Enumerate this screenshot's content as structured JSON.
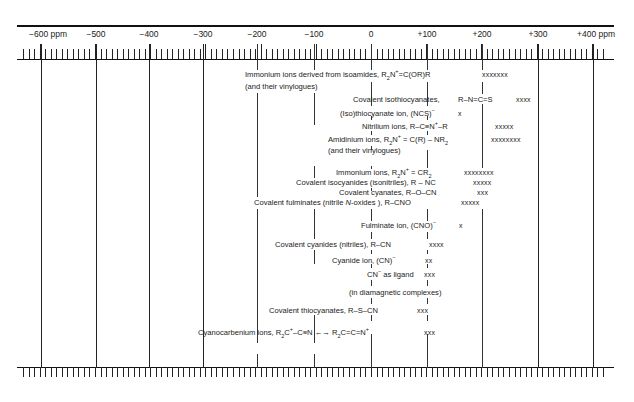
{
  "chart_data": {
    "type": "range-chart",
    "title": "",
    "xlabel": "ppm",
    "axis": {
      "min": -650,
      "max": 420,
      "major_ticks": [
        -600,
        -500,
        -400,
        -300,
        -200,
        -100,
        0,
        100,
        200,
        300,
        400
      ],
      "tick_labels": [
        "−600 ppm",
        "−500",
        "−400",
        "−300",
        "−200",
        "−100",
        "0",
        "+100",
        "+200",
        "+300",
        "+400 ppm"
      ],
      "minor_tick_step": 10,
      "grid": true
    },
    "entries": [
      {
        "label": "Immonium ions derived from isoamides, R₂N⁺=C(OR)R (and their vinylogues)",
        "range_ppm": [
          -200,
          0
        ],
        "marker": "xxxxxxx",
        "marker_ppm": 200
      },
      {
        "label": "Covalent isothiocyanates, R–N=C=S",
        "range_ppm": [
          -100,
          100
        ],
        "marker": "xxxx",
        "marker_ppm": 270
      },
      {
        "label": "(Iso)thiocyanate ion, (NCS)⁻",
        "range_ppm": [
          0,
          100
        ],
        "marker": "x",
        "marker_ppm": 165
      },
      {
        "label": "Nitrilium ions, R–C≡N⁺–R",
        "range_ppm": [
          0,
          100
        ],
        "marker": "xxxxx",
        "marker_ppm": 215
      },
      {
        "label": "Amidinium ions, R₂N⁺ = C(R) – NR₂ (and their vinylogues)",
        "range_ppm": [
          0,
          100
        ],
        "marker": "xxxxxxxx",
        "marker_ppm": 215
      },
      {
        "label": "Immonium ions, R₂N⁺ = CR₂",
        "range_ppm": [
          0,
          100
        ],
        "marker": "xxxxxxxx",
        "marker_ppm": 195
      },
      {
        "label": "Covalent isocyanides (isonitriles), R – NC",
        "range_ppm": [
          -100,
          100
        ],
        "marker": "xxxxx",
        "marker_ppm": 200
      },
      {
        "label": "Covalent cyanates, R–O–CN",
        "range_ppm": [
          0,
          100
        ],
        "marker": "xxx",
        "marker_ppm": 200
      },
      {
        "label": "Covalent fulminates (nitrile N-oxides), R–CNO",
        "range_ppm": [
          -200,
          100
        ],
        "marker": "xxxxx",
        "marker_ppm": 180
      },
      {
        "label": "Fulminate ion, (CNO)⁻",
        "range_ppm": [
          0,
          100
        ],
        "marker": "x",
        "marker_ppm": 165
      },
      {
        "label": "Covalent cyanides (nitriles), R–CN",
        "range_ppm": [
          -100,
          100
        ],
        "marker": "xxxx",
        "marker_ppm": 130
      },
      {
        "label": "Cyanide ion, (CN)⁻",
        "range_ppm": [
          -100,
          100
        ],
        "marker": "xx",
        "marker_ppm": 100
      },
      {
        "label": "CN⁻ as ligand (in diamagnetic complexes)",
        "range_ppm": [
          0,
          100
        ],
        "marker": "xxx",
        "marker_ppm": 120
      },
      {
        "label": "Covalent thiocyanates, R–S–CN",
        "range_ppm": [
          0,
          100
        ],
        "marker": "xxx",
        "marker_ppm": 100
      },
      {
        "label": "Cyanocarbenium ions, R₂C⁺–C≡N ↔ R₂C=C=N⁺",
        "range_ppm": [
          0,
          100
        ],
        "marker": "xxx",
        "marker_ppm": 100
      }
    ]
  },
  "axis_labels": {
    "t0": "−600 ppm",
    "t1": "−500",
    "t2": "−400",
    "t3": "−300",
    "t4": "−200",
    "t5": "−100",
    "t6": "0",
    "t7": "+100",
    "t8": "+200",
    "t9": "+300",
    "t10": "+400 ppm"
  },
  "labels": {
    "immonium_iso_a": "Immonium ions derived from isoamides, R",
    "immonium_iso_b": "N",
    "immonium_iso_c": "=C(OR)R",
    "immonium_iso_vin": "(and their vinylogues)",
    "isothiocyanates_a": "Covalent isothiocyanates,",
    "isothiocyanates_b": "R–N=C=S",
    "isothiocyanate_ion": "(Iso)thiocyanate ion,  (NCS)",
    "nitrilium": "Nitrilium ions,  R–C≡N",
    "nitrilium_end": "–R",
    "amidinium_a": "Amidinium ions, R",
    "amidinium_b": "N",
    "amidinium_c": " = C(R) – NR",
    "amidinium_vin": "(and their vinylogues)",
    "immonium_a": "Immonium ions, R",
    "immonium_b": "N",
    "immonium_c": " = CR",
    "isocyanides": "Covalent isocyanides  (isonitriles),  R – NC",
    "cyanates": "Covalent cyanates,   R–O–CN",
    "fulminates_a": "Covalent fulminates (nitrile ",
    "fulminates_n": "N",
    "fulminates_b": "-oxides ),   R–CNO",
    "fulminate_ion": "Fulminate ion,  (CNO)",
    "cyanides": "Covalent cyanides  (nitriles),  R–CN",
    "cyanide_ion": "Cyanide ion, (CN)",
    "cn_ligand_a": "CN",
    "cn_ligand_b": "  as ligand",
    "cn_ligand_c": "(in diamagnetic complexes)",
    "thiocyanates": "Covalent thiocyanates, R–S–CN",
    "cyanocarbenium_a": "Cyanocarbenium ions, R",
    "cyanocarbenium_b": "C",
    "cyanocarbenium_c": "–C≡N  ←→  R",
    "cyanocarbenium_d": "C=C=N",
    "sub2": "2",
    "plus": "+",
    "minus": "−"
  },
  "markers": {
    "m1": "xxxxxxx",
    "m2": "xxxx",
    "m3": "x",
    "m4": "xxxxx",
    "m5": "xxxxxxxx",
    "m6": "xxxxxxxx",
    "m7": "xxxxx",
    "m8": "xxx",
    "m9": "xxxxx",
    "m10": "x",
    "m11": "xxxx",
    "m12": "xx",
    "m13": "xxx",
    "m14": "xxx",
    "m15": "xxx"
  }
}
